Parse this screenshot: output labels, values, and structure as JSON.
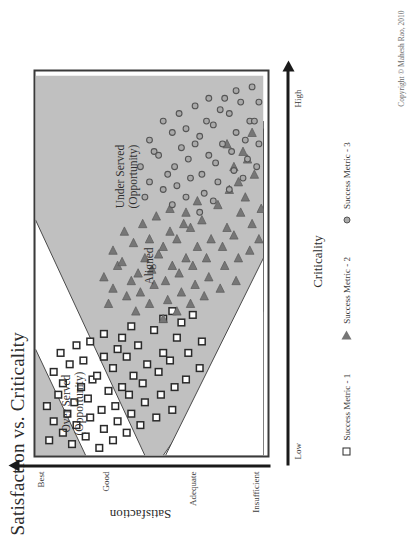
{
  "figure": {
    "title": "Satisfaction vs. Criticality",
    "copyright": "Copyright © Mahesh Rao, 2010"
  },
  "axes": {
    "y": {
      "title": "Satisfaction",
      "ticks": [
        "Best",
        "Good",
        "Adequate",
        "Insufficient"
      ]
    },
    "x": {
      "title": "Criticality",
      "ticks": [
        "Low",
        "High"
      ]
    }
  },
  "regions": [
    {
      "id": "over-served",
      "label_line1": "Over Served",
      "label_line2": "(Opportunity)"
    },
    {
      "id": "aligned",
      "label_line1": "Aligned",
      "label_line2": ""
    },
    {
      "id": "under-served",
      "label_line1": "Under Served",
      "label_line2": "(Opportunity)"
    }
  ],
  "legend": [
    {
      "marker": "square-marker",
      "label": "Success Metric - 1"
    },
    {
      "marker": "triangle-marker",
      "label": "Success Metric - 2"
    },
    {
      "marker": "circle-marker",
      "label": "Success Metric - 3"
    }
  ],
  "colors": {
    "band_fill": "#c0c0c0",
    "band_stroke": "#4a4a4a",
    "frame_stroke": "#3a3a3a",
    "axis": "#1a1a1a",
    "square_stroke": "#2a2a2a",
    "triangle_fill": "#767676",
    "circle_fill": "#a9a9a9",
    "plot_bg": "#ffffff"
  },
  "chart_data": {
    "type": "scatter",
    "title": "Satisfaction vs. Criticality",
    "xlabel": "Criticality",
    "ylabel": "Satisfaction",
    "xlim": [
      0,
      100
    ],
    "ylim": [
      0,
      100
    ],
    "xtick_labels": [
      "Low",
      "High"
    ],
    "xtick_values": [
      2,
      98
    ],
    "ytick_labels": [
      "Best",
      "Good",
      "Adequate",
      "Insufficient"
    ],
    "ytick_values": [
      96,
      68,
      30,
      3
    ],
    "grid": false,
    "legend_position": "below-left",
    "annotations": [
      {
        "text": "Over Served (Opportunity)",
        "x": 10,
        "y": 82
      },
      {
        "text": "Aligned",
        "x": 46,
        "y": 52
      },
      {
        "text": "Under Served (Opportunity)",
        "x": 66,
        "y": 62
      }
    ],
    "bands": [
      {
        "name": "Over Served (Opportunity)",
        "fill": "#c0c0c0",
        "polygon": [
          [
            0,
            100
          ],
          [
            30,
            100
          ],
          [
            0,
            55
          ]
        ]
      },
      {
        "name": "Over Served (Opportunity) lower",
        "fill": "#c0c0c0",
        "polygon": [
          [
            0,
            48
          ],
          [
            0,
            0
          ],
          [
            47,
            0
          ],
          [
            0,
            48
          ]
        ]
      },
      {
        "name": "Under Served (Opportunity)",
        "fill": "#c0c0c0",
        "polygon": [
          [
            44,
            100
          ],
          [
            100,
            100
          ],
          [
            100,
            0
          ],
          [
            100,
            0
          ]
        ]
      }
    ],
    "series": [
      {
        "name": "Success Metric - 1",
        "marker": "square",
        "fill": "none",
        "stroke": "#2a2a2a",
        "points": [
          [
            4,
            94
          ],
          [
            9,
            92
          ],
          [
            13,
            95
          ],
          [
            16,
            90
          ],
          [
            6,
            88
          ],
          [
            11,
            86
          ],
          [
            19,
            88
          ],
          [
            22,
            92
          ],
          [
            3,
            84
          ],
          [
            8,
            82
          ],
          [
            14,
            83
          ],
          [
            18,
            80
          ],
          [
            24,
            85
          ],
          [
            27,
            89
          ],
          [
            5,
            78
          ],
          [
            10,
            76
          ],
          [
            15,
            77
          ],
          [
            20,
            75
          ],
          [
            25,
            79
          ],
          [
            29,
            82
          ],
          [
            2,
            72
          ],
          [
            7,
            70
          ],
          [
            12,
            71
          ],
          [
            17,
            68
          ],
          [
            21,
            73
          ],
          [
            26,
            70
          ],
          [
            30,
            76
          ],
          [
            4,
            66
          ],
          [
            9,
            64
          ],
          [
            13,
            65
          ],
          [
            18,
            62
          ],
          [
            23,
            66
          ],
          [
            28,
            64
          ],
          [
            32,
            70
          ],
          [
            6,
            60
          ],
          [
            11,
            58
          ],
          [
            16,
            59
          ],
          [
            21,
            57
          ],
          [
            26,
            60
          ],
          [
            31,
            62
          ],
          [
            8,
            54
          ],
          [
            14,
            52
          ],
          [
            19,
            53
          ],
          [
            24,
            51
          ],
          [
            29,
            55
          ],
          [
            34,
            58
          ],
          [
            10,
            47
          ],
          [
            16,
            45
          ],
          [
            22,
            46
          ],
          [
            27,
            44
          ],
          [
            33,
            48
          ],
          [
            12,
            40
          ],
          [
            18,
            39
          ],
          [
            25,
            41
          ],
          [
            31,
            38
          ],
          [
            36,
            44
          ],
          [
            20,
            34
          ],
          [
            27,
            33
          ],
          [
            35,
            36
          ],
          [
            38,
            40
          ],
          [
            23,
            28
          ],
          [
            30,
            27
          ],
          [
            37,
            31
          ]
        ]
      },
      {
        "name": "Success Metric - 2",
        "marker": "triangle",
        "fill": "#767676",
        "stroke": "#5a5a5a",
        "points": [
          [
            40,
            68
          ],
          [
            44,
            66
          ],
          [
            47,
            70
          ],
          [
            50,
            64
          ],
          [
            42,
            60
          ],
          [
            46,
            58
          ],
          [
            51,
            62
          ],
          [
            54,
            66
          ],
          [
            38,
            56
          ],
          [
            43,
            54
          ],
          [
            48,
            55
          ],
          [
            52,
            52
          ],
          [
            56,
            57
          ],
          [
            59,
            61
          ],
          [
            40,
            50
          ],
          [
            45,
            48
          ],
          [
            49,
            49
          ],
          [
            53,
            46
          ],
          [
            57,
            50
          ],
          [
            61,
            53
          ],
          [
            36,
            44
          ],
          [
            41,
            42
          ],
          [
            46,
            43
          ],
          [
            50,
            40
          ],
          [
            55,
            44
          ],
          [
            59,
            41
          ],
          [
            63,
            47
          ],
          [
            38,
            38
          ],
          [
            43,
            36
          ],
          [
            48,
            37
          ],
          [
            52,
            34
          ],
          [
            57,
            38
          ],
          [
            61,
            35
          ],
          [
            65,
            41
          ],
          [
            40,
            32
          ],
          [
            45,
            30
          ],
          [
            50,
            31
          ],
          [
            55,
            29
          ],
          [
            60,
            32
          ],
          [
            64,
            34
          ],
          [
            42,
            26
          ],
          [
            47,
            24
          ],
          [
            52,
            25
          ],
          [
            57,
            23
          ],
          [
            62,
            27
          ],
          [
            67,
            29
          ],
          [
            44,
            19
          ],
          [
            50,
            17
          ],
          [
            55,
            18
          ],
          [
            60,
            16
          ],
          [
            66,
            20
          ],
          [
            46,
            12
          ],
          [
            52,
            11
          ],
          [
            58,
            13
          ],
          [
            64,
            10
          ],
          [
            70,
            15
          ],
          [
            54,
            6
          ],
          [
            61,
            5
          ],
          [
            68,
            8
          ],
          [
            72,
            11
          ],
          [
            57,
            2
          ],
          [
            65,
            1
          ],
          [
            74,
            4
          ],
          [
            78,
            7
          ],
          [
            76,
            13
          ],
          [
            80,
            9
          ],
          [
            82,
            16
          ],
          [
            85,
            5
          ]
        ]
      },
      {
        "name": "Success Metric - 3",
        "marker": "circle",
        "fill": "#a9a9a9",
        "stroke": "#555555",
        "points": [
          [
            68,
            52
          ],
          [
            72,
            50
          ],
          [
            76,
            54
          ],
          [
            80,
            48
          ],
          [
            70,
            44
          ],
          [
            74,
            42
          ],
          [
            79,
            46
          ],
          [
            83,
            50
          ],
          [
            66,
            40
          ],
          [
            71,
            38
          ],
          [
            76,
            39
          ],
          [
            81,
            36
          ],
          [
            85,
            40
          ],
          [
            88,
            44
          ],
          [
            68,
            34
          ],
          [
            73,
            32
          ],
          [
            78,
            33
          ],
          [
            82,
            30
          ],
          [
            86,
            34
          ],
          [
            90,
            37
          ],
          [
            64,
            28
          ],
          [
            69,
            26
          ],
          [
            74,
            27
          ],
          [
            79,
            24
          ],
          [
            84,
            28
          ],
          [
            88,
            25
          ],
          [
            92,
            30
          ],
          [
            67,
            22
          ],
          [
            72,
            20
          ],
          [
            77,
            21
          ],
          [
            82,
            18
          ],
          [
            87,
            22
          ],
          [
            91,
            19
          ],
          [
            94,
            24
          ],
          [
            70,
            15
          ],
          [
            75,
            13
          ],
          [
            80,
            14
          ],
          [
            85,
            12
          ],
          [
            90,
            15
          ],
          [
            94,
            17
          ],
          [
            73,
            9
          ],
          [
            78,
            7
          ],
          [
            83,
            8
          ],
          [
            88,
            6
          ],
          [
            93,
            10
          ],
          [
            96,
            12
          ],
          [
            76,
            3
          ],
          [
            82,
            2
          ],
          [
            88,
            4
          ],
          [
            93,
            2
          ],
          [
            97,
            5
          ]
        ]
      }
    ]
  }
}
